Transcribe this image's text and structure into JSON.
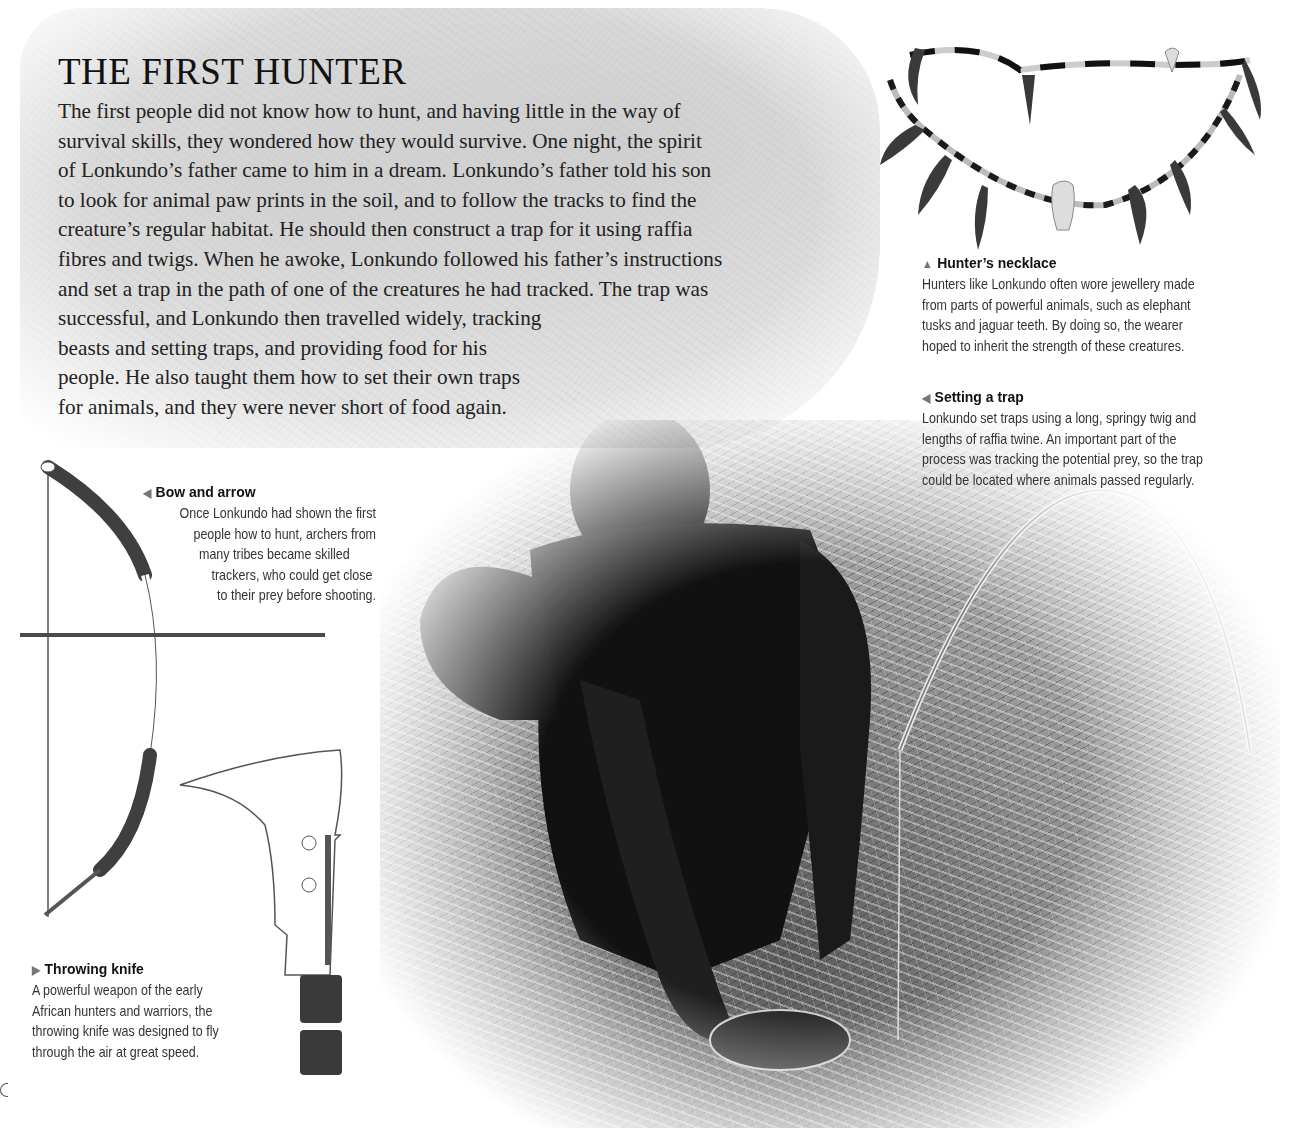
{
  "story": {
    "title": "THE FIRST HUNTER",
    "lines": [
      "The first people did not know how to hunt, and having little in the way of",
      "survival skills, they wondered how they would survive. One night, the spirit",
      "of Lonkundo’s father came to him in a dream. Lonkundo’s father told his son",
      "to look for animal paw prints in the soil, and to follow the tracks to find the",
      "creature’s regular habitat. He should then construct a trap for it using raffia",
      "fibres and twigs. When he awoke, Lonkundo followed his father’s instructions",
      "and set a trap in the path of one of the creatures he had tracked. The trap was",
      "successful, and Lonkundo then travelled widely, tracking",
      "beasts and setting traps, and providing food for his",
      "people. He also taught them how to set their own traps",
      "for animals, and they were never short of food again."
    ]
  },
  "captions": {
    "necklace": {
      "marker": "▲",
      "title": "Hunter’s necklace",
      "lines": [
        "Hunters like Lonkundo often wore jewellery made",
        "from parts of powerful animals, such as elephant",
        "tusks and jaguar teeth. By doing so, the wearer",
        "hoped to inherit the strength of these creatures."
      ]
    },
    "trap": {
      "marker": "◀",
      "title": "Setting a trap",
      "lines": [
        "Lonkundo set traps using a long, springy twig and",
        "lengths of raffia twine. An important part of the",
        "process was tracking the potential prey, so the trap",
        "could be located where animals passed regularly."
      ]
    },
    "bow": {
      "marker": "◀",
      "title": "Bow and arrow",
      "lines": [
        "Once Lonkundo had shown the first",
        "people how to hunt, archers from",
        "many tribes became skilled",
        "trackers, who could get close",
        "to their prey before shooting."
      ]
    },
    "knife": {
      "marker": "▶",
      "title": "Throwing knife",
      "lines": [
        "A powerful weapon of the early",
        "African hunters and warriors, the",
        "throwing knife was designed to fly",
        "through the air at great speed."
      ]
    }
  },
  "colors": {
    "text": "#222222",
    "caption_text": "#333333",
    "bow_dark": "#3f3f3f",
    "background_texture": "#e6e6e6"
  }
}
